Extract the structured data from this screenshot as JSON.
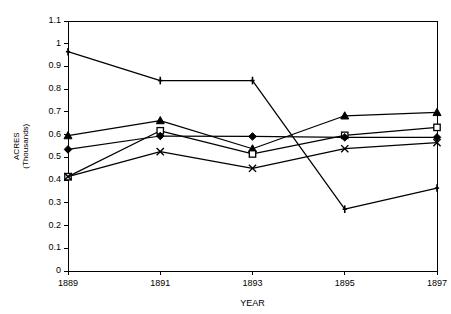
{
  "chart_data": {
    "type": "line",
    "title": "",
    "xlabel": "YEAR",
    "ylabel": "ACRES (Thousands)",
    "ylabel_line1": "ACRES",
    "ylabel_line2": "(Thousands)",
    "categories": [
      "1889",
      "1891",
      "1893",
      "1895",
      "1897"
    ],
    "x": [
      1889,
      1891,
      1893,
      1895,
      1897
    ],
    "xlim": [
      1889,
      1897
    ],
    "ylim": [
      0,
      1.1
    ],
    "ytick_labels": [
      "0",
      "0.1",
      "0.2",
      "0.3",
      "0.4",
      "0.5",
      "0.6",
      "0.7",
      "0.8",
      "0.9",
      "1",
      "1.1"
    ],
    "ytick_values": [
      0,
      0.1,
      0.2,
      0.3,
      0.4,
      0.5,
      0.6,
      0.7,
      0.8,
      0.9,
      1.0,
      1.1
    ],
    "grid": false,
    "legend": "none",
    "line_color": "#000000",
    "axis_color": "#000000",
    "background": "#ffffff",
    "series": [
      {
        "name": "Series 1",
        "marker": "plus",
        "values": [
          0.965,
          0.838,
          0.838,
          0.272,
          0.365
        ]
      },
      {
        "name": "Series 2",
        "marker": "triangle",
        "values": [
          0.596,
          0.662,
          0.538,
          0.683,
          0.698
        ]
      },
      {
        "name": "Series 3",
        "marker": "square",
        "values": [
          0.415,
          0.617,
          0.515,
          0.597,
          0.632
        ]
      },
      {
        "name": "Series 4",
        "marker": "diamond",
        "values": [
          0.535,
          0.594,
          0.592,
          0.588,
          0.588
        ]
      },
      {
        "name": "Series 5",
        "marker": "cross",
        "values": [
          0.415,
          0.525,
          0.452,
          0.538,
          0.565
        ]
      }
    ]
  }
}
